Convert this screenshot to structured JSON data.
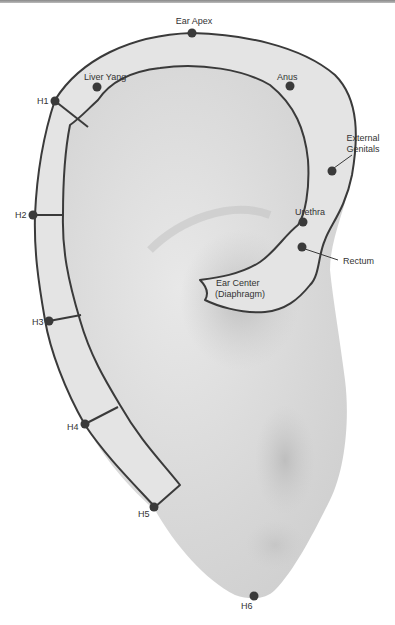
{
  "diagram": {
    "points": {
      "ear_apex": "Ear Apex",
      "liver_yang": "Liver Yang",
      "anus": "Anus",
      "external_genitals_1": "External",
      "external_genitals_2": "Genitals",
      "urethra": "Urethra",
      "rectum": "Rectum",
      "ear_center_1": "Ear Center",
      "ear_center_2": "(Diaphragm)",
      "h1": "H1",
      "h2": "H2",
      "h3": "H3",
      "h4": "H4",
      "h5": "H5",
      "h6": "H6"
    },
    "colors": {
      "ear_fill": "#dcdcdc",
      "helix_fill": "#e6e6e6",
      "outline": "#3a3a3a",
      "point": "#3a3a3a"
    }
  }
}
